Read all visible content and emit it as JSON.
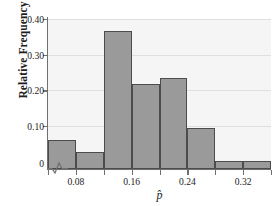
{
  "chart_data": {
    "type": "bar",
    "title": "",
    "subtitle": "",
    "xlabel": "p̂",
    "xlabel_plain": "p-hat",
    "ylabel": "Relative Frequency",
    "grid": "horizontal",
    "legend": "none",
    "axis_break": "y-axis zigzag break near origin",
    "bin_width": 0.04,
    "xlim": [
      0.04,
      0.36
    ],
    "ylim": [
      0,
      0.42
    ],
    "x_tick_labels": [
      "0.08",
      "0.16",
      "0.24",
      "0.32"
    ],
    "x_tick_values": [
      0.08,
      0.16,
      0.24,
      0.32
    ],
    "y_tick_labels": [
      "0",
      "0.10",
      "0.20",
      "0.30",
      "0.40"
    ],
    "y_tick_values": [
      0,
      0.1,
      0.2,
      0.3,
      0.4
    ],
    "bin_edges": [
      0.04,
      0.08,
      0.12,
      0.16,
      0.2,
      0.24,
      0.28,
      0.32,
      0.36
    ],
    "categories": [
      "0.04-0.08",
      "0.08-0.12",
      "0.12-0.16",
      "0.16-0.20",
      "0.20-0.24",
      "0.24-0.28",
      "0.28-0.32",
      "0.32-0.36"
    ],
    "values": [
      0.08,
      0.048,
      0.385,
      0.237,
      0.253,
      0.115,
      0.02,
      0.02
    ],
    "bar_fill_color": "#9a9a9a",
    "bar_edge_color": "#4c4c4c",
    "plot_background_color": "#f5f5f5",
    "gridline_color": "#dfdfdf",
    "axis_color": "#6f6f6f"
  }
}
